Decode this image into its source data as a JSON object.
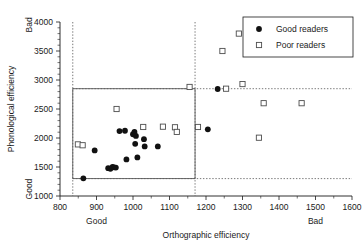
{
  "chart_data": {
    "type": "scatter",
    "title": "",
    "xlabel": "Orthographic efficiency",
    "ylabel": "Phonological efficiency",
    "xlim": [
      800,
      1600
    ],
    "ylim": [
      1000,
      4000
    ],
    "xticks": [
      800,
      900,
      1000,
      1100,
      1200,
      1300,
      1400,
      1500,
      1600
    ],
    "yticks": [
      1000,
      1500,
      2000,
      2500,
      3000,
      3500,
      4000
    ],
    "grid": false,
    "x_axis_pole_low": "Good",
    "x_axis_pole_high": "Bad",
    "y_axis_pole_low": "Good",
    "y_axis_pole_high": "Bad",
    "legend_position": "top-right",
    "series": [
      {
        "name": "Good readers",
        "marker": "filled-circle",
        "color": "#111111",
        "points": [
          [
            864,
            1305
          ],
          [
            895,
            1785
          ],
          [
            932,
            1480
          ],
          [
            938,
            1470
          ],
          [
            944,
            1500
          ],
          [
            948,
            1495
          ],
          [
            953,
            1490
          ],
          [
            963,
            2120
          ],
          [
            978,
            2125
          ],
          [
            982,
            1630
          ],
          [
            1000,
            2065
          ],
          [
            1004,
            2105
          ],
          [
            1006,
            1900
          ],
          [
            1008,
            2035
          ],
          [
            1012,
            1665
          ],
          [
            1030,
            1980
          ],
          [
            1032,
            1855
          ],
          [
            1068,
            1855
          ],
          [
            1205,
            2150
          ],
          [
            1232,
            2845
          ]
        ]
      },
      {
        "name": "Poor readers",
        "marker": "open-square",
        "color": "#4d4d4d",
        "points": [
          [
            849,
            1890
          ],
          [
            862,
            1875
          ],
          [
            955,
            2500
          ],
          [
            1028,
            2190
          ],
          [
            1082,
            2195
          ],
          [
            1115,
            2185
          ],
          [
            1120,
            2105
          ],
          [
            1155,
            2880
          ],
          [
            1178,
            2190
          ],
          [
            1245,
            3500
          ],
          [
            1255,
            2850
          ],
          [
            1290,
            3800
          ],
          [
            1300,
            2930
          ],
          [
            1345,
            2005
          ],
          [
            1358,
            2600
          ],
          [
            1462,
            2600
          ]
        ]
      }
    ],
    "reference_lines": [
      {
        "orientation": "vertical",
        "value": 835,
        "style": "dotted"
      },
      {
        "orientation": "vertical",
        "value": 1170,
        "style": "dotted"
      },
      {
        "orientation": "horizontal",
        "value": 2850,
        "style": "dotted"
      },
      {
        "orientation": "horizontal",
        "value": 1300,
        "style": "dotted"
      }
    ],
    "reference_box": {
      "x0": 835,
      "x1": 1170,
      "y0": 1300,
      "y1": 2850,
      "style": "solid"
    }
  }
}
